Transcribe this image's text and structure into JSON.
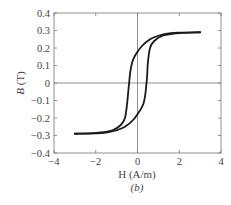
{
  "chart_data": {
    "type": "line",
    "title": "",
    "caption": "(b)",
    "xlabel": "H (A/m)",
    "ylabel": "B (T)",
    "xlim": [
      -4,
      4
    ],
    "ylim": [
      -0.4,
      0.4
    ],
    "xticks": [
      -4,
      -2,
      0,
      2,
      4
    ],
    "xtick_labels": [
      "−4",
      "−2",
      "0",
      "2",
      "4"
    ],
    "yticks": [
      0.4,
      0.3,
      0.2,
      0.1,
      0,
      -0.1,
      -0.2,
      -0.3,
      -0.4
    ],
    "ytick_labels": [
      "0.4",
      "0.3",
      "0.2",
      "0.1",
      "0",
      "−0.1",
      "−0.2",
      "−0.3",
      "−0.4"
    ],
    "grid": false,
    "zero_lines": true,
    "legend": null,
    "series": [
      {
        "name": "ascending branch",
        "x": [
          -3.0,
          -2.0,
          -1.2,
          -0.8,
          -0.6,
          -0.5,
          -0.45,
          -0.42,
          -0.4,
          -0.35,
          -0.25,
          -0.1,
          0.2,
          0.6,
          1.0,
          1.5,
          2.0,
          3.0
        ],
        "y": [
          -0.29,
          -0.285,
          -0.27,
          -0.24,
          -0.2,
          -0.12,
          -0.06,
          -0.02,
          0.0,
          0.06,
          0.12,
          0.16,
          0.21,
          0.25,
          0.27,
          0.283,
          0.288,
          0.29
        ]
      },
      {
        "name": "descending branch",
        "x": [
          3.0,
          2.0,
          1.2,
          0.8,
          0.6,
          0.5,
          0.47,
          0.45,
          0.43,
          0.38,
          0.28,
          0.1,
          -0.2,
          -0.6,
          -1.0,
          -1.5,
          -2.0,
          -3.0
        ],
        "y": [
          0.29,
          0.285,
          0.27,
          0.24,
          0.2,
          0.12,
          0.06,
          0.02,
          0.0,
          -0.06,
          -0.12,
          -0.16,
          -0.21,
          -0.25,
          -0.27,
          -0.283,
          -0.288,
          -0.29
        ]
      }
    ]
  }
}
